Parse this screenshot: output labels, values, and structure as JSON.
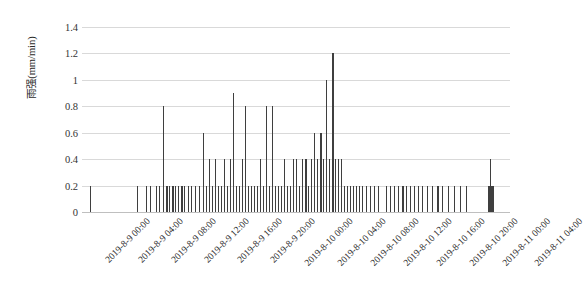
{
  "chart_data": {
    "type": "bar",
    "title": "",
    "xlabel": "",
    "ylabel": "雨强(mm/min)",
    "ylim": [
      0,
      1.4
    ],
    "ytick_labels": [
      "0",
      "0.2",
      "0.4",
      "0.6",
      "0.8",
      "1",
      "1.2",
      "1.4"
    ],
    "ytick_values": [
      0,
      0.2,
      0.4,
      0.6,
      0.8,
      1.0,
      1.2,
      1.4
    ],
    "grid": true,
    "legend": "none",
    "xtick_labels": [
      "2019-8-9 00:00",
      "2019-8-9 04:00",
      "2019-8-9 08:00",
      "2019-8-9 12:00",
      "2019-8-9 16:00",
      "2019-8-9 20:00",
      "2019-8-10 00:00",
      "2019-8-10 04:00",
      "2019-8-10 08:00",
      "2019-8-10 12:00",
      "2019-8-10 16:00",
      "2019-8-10 20:00",
      "2019-8-11 00:00",
      "2019-8-11 04:00"
    ],
    "xtick_positions_px": [
      82,
      115,
      148,
      181,
      214,
      247,
      280,
      313,
      346,
      379,
      412,
      445,
      478,
      510
    ],
    "bar_color": "#3f3f3f",
    "x_start": "2019-8-9 00:00",
    "x_end": "2019-8-11 04:00",
    "x_unit": "time",
    "series_name": "雨强",
    "bars": [
      {
        "x": 90,
        "w": 1.2,
        "v": 0.2
      },
      {
        "x": 137,
        "w": 1.0,
        "v": 0.2
      },
      {
        "x": 146,
        "w": 1.4,
        "v": 0.2
      },
      {
        "x": 150,
        "w": 1.0,
        "v": 0.2
      },
      {
        "x": 156,
        "w": 1.2,
        "v": 0.2
      },
      {
        "x": 159,
        "w": 1.0,
        "v": 0.2
      },
      {
        "x": 163,
        "w": 1.0,
        "v": 0.8
      },
      {
        "x": 166,
        "w": 1.6,
        "v": 0.2
      },
      {
        "x": 169,
        "w": 1.0,
        "v": 0.2
      },
      {
        "x": 172,
        "w": 1.8,
        "v": 0.2
      },
      {
        "x": 175,
        "w": 1.2,
        "v": 0.2
      },
      {
        "x": 178,
        "w": 1.0,
        "v": 0.2
      },
      {
        "x": 181,
        "w": 1.6,
        "v": 0.2
      },
      {
        "x": 184,
        "w": 1.0,
        "v": 0.2
      },
      {
        "x": 188,
        "w": 1.2,
        "v": 0.2
      },
      {
        "x": 191,
        "w": 1.0,
        "v": 0.2
      },
      {
        "x": 195,
        "w": 1.0,
        "v": 0.2
      },
      {
        "x": 199,
        "w": 1.2,
        "v": 0.2
      },
      {
        "x": 203,
        "w": 1.0,
        "v": 0.6
      },
      {
        "x": 206,
        "w": 1.4,
        "v": 0.2
      },
      {
        "x": 209,
        "w": 1.0,
        "v": 0.4
      },
      {
        "x": 212,
        "w": 1.2,
        "v": 0.2
      },
      {
        "x": 215,
        "w": 1.0,
        "v": 0.4
      },
      {
        "x": 218,
        "w": 1.4,
        "v": 0.2
      },
      {
        "x": 221,
        "w": 1.0,
        "v": 0.2
      },
      {
        "x": 224,
        "w": 1.2,
        "v": 0.4
      },
      {
        "x": 227,
        "w": 1.0,
        "v": 0.2
      },
      {
        "x": 230,
        "w": 1.2,
        "v": 0.4
      },
      {
        "x": 233,
        "w": 1.4,
        "v": 0.9
      },
      {
        "x": 236,
        "w": 1.0,
        "v": 0.2
      },
      {
        "x": 239,
        "w": 1.2,
        "v": 0.2
      },
      {
        "x": 242,
        "w": 1.0,
        "v": 0.4
      },
      {
        "x": 245,
        "w": 1.2,
        "v": 0.8
      },
      {
        "x": 248,
        "w": 1.0,
        "v": 0.2
      },
      {
        "x": 251,
        "w": 1.4,
        "v": 0.2
      },
      {
        "x": 254,
        "w": 1.0,
        "v": 0.2
      },
      {
        "x": 257,
        "w": 1.2,
        "v": 0.2
      },
      {
        "x": 260,
        "w": 1.0,
        "v": 0.4
      },
      {
        "x": 263,
        "w": 1.2,
        "v": 0.2
      },
      {
        "x": 266,
        "w": 1.0,
        "v": 0.8
      },
      {
        "x": 269,
        "w": 1.2,
        "v": 0.2
      },
      {
        "x": 272,
        "w": 1.4,
        "v": 0.8
      },
      {
        "x": 275,
        "w": 1.0,
        "v": 0.2
      },
      {
        "x": 278,
        "w": 1.2,
        "v": 0.2
      },
      {
        "x": 281,
        "w": 1.0,
        "v": 0.2
      },
      {
        "x": 284,
        "w": 1.4,
        "v": 0.4
      },
      {
        "x": 287,
        "w": 1.0,
        "v": 0.2
      },
      {
        "x": 290,
        "w": 1.2,
        "v": 0.2
      },
      {
        "x": 293,
        "w": 1.0,
        "v": 0.4
      },
      {
        "x": 296,
        "w": 1.4,
        "v": 0.4
      },
      {
        "x": 299,
        "w": 1.2,
        "v": 0.2
      },
      {
        "x": 302,
        "w": 1.0,
        "v": 0.4
      },
      {
        "x": 305,
        "w": 1.6,
        "v": 0.4
      },
      {
        "x": 308,
        "w": 1.0,
        "v": 0.2
      },
      {
        "x": 311,
        "w": 1.2,
        "v": 0.4
      },
      {
        "x": 314,
        "w": 1.4,
        "v": 0.6
      },
      {
        "x": 317,
        "w": 1.0,
        "v": 0.4
      },
      {
        "x": 320,
        "w": 1.6,
        "v": 0.6
      },
      {
        "x": 323,
        "w": 1.2,
        "v": 0.4
      },
      {
        "x": 326,
        "w": 1.4,
        "v": 1.0
      },
      {
        "x": 329,
        "w": 1.0,
        "v": 0.4
      },
      {
        "x": 332,
        "w": 1.6,
        "v": 1.2
      },
      {
        "x": 335,
        "w": 1.2,
        "v": 0.4
      },
      {
        "x": 338,
        "w": 1.0,
        "v": 0.4
      },
      {
        "x": 341,
        "w": 1.4,
        "v": 0.4
      },
      {
        "x": 344,
        "w": 1.0,
        "v": 0.2
      },
      {
        "x": 347,
        "w": 1.2,
        "v": 0.2
      },
      {
        "x": 350,
        "w": 1.0,
        "v": 0.2
      },
      {
        "x": 353,
        "w": 1.4,
        "v": 0.2
      },
      {
        "x": 356,
        "w": 1.0,
        "v": 0.2
      },
      {
        "x": 359,
        "w": 1.2,
        "v": 0.2
      },
      {
        "x": 362,
        "w": 1.0,
        "v": 0.2
      },
      {
        "x": 366,
        "w": 1.2,
        "v": 0.2
      },
      {
        "x": 370,
        "w": 1.0,
        "v": 0.2
      },
      {
        "x": 374,
        "w": 1.4,
        "v": 0.2
      },
      {
        "x": 378,
        "w": 1.0,
        "v": 0.2
      },
      {
        "x": 386,
        "w": 1.2,
        "v": 0.2
      },
      {
        "x": 390,
        "w": 1.0,
        "v": 0.2
      },
      {
        "x": 394,
        "w": 1.4,
        "v": 0.2
      },
      {
        "x": 398,
        "w": 1.0,
        "v": 0.2
      },
      {
        "x": 402,
        "w": 1.6,
        "v": 0.2
      },
      {
        "x": 406,
        "w": 1.0,
        "v": 0.2
      },
      {
        "x": 410,
        "w": 1.2,
        "v": 0.2
      },
      {
        "x": 414,
        "w": 1.0,
        "v": 0.2
      },
      {
        "x": 418,
        "w": 1.4,
        "v": 0.2
      },
      {
        "x": 422,
        "w": 1.0,
        "v": 0.2
      },
      {
        "x": 427,
        "w": 1.2,
        "v": 0.2
      },
      {
        "x": 432,
        "w": 1.0,
        "v": 0.2
      },
      {
        "x": 437,
        "w": 1.6,
        "v": 0.2
      },
      {
        "x": 442,
        "w": 1.0,
        "v": 0.2
      },
      {
        "x": 448,
        "w": 1.4,
        "v": 0.2
      },
      {
        "x": 454,
        "w": 1.0,
        "v": 0.2
      },
      {
        "x": 460,
        "w": 1.2,
        "v": 0.2
      },
      {
        "x": 466,
        "w": 1.0,
        "v": 0.2
      },
      {
        "x": 488,
        "w": 6.0,
        "v": 0.2
      },
      {
        "x": 490,
        "w": 1.2,
        "v": 0.4
      }
    ]
  }
}
